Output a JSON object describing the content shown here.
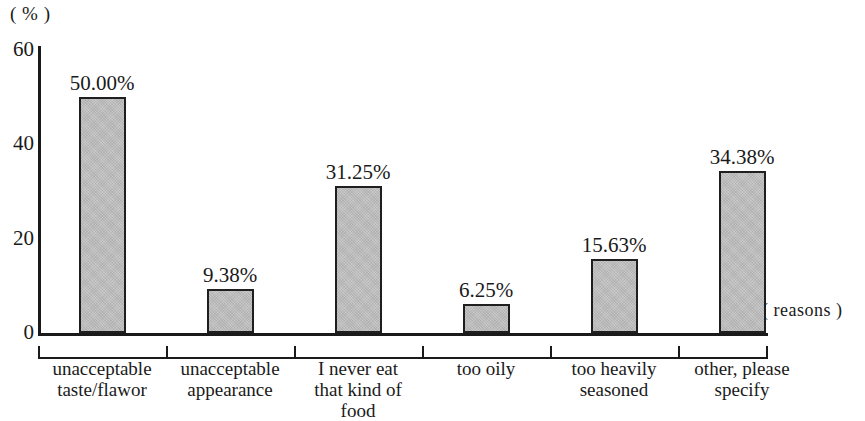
{
  "chart_data": {
    "type": "bar",
    "title": "",
    "subtitle": "",
    "xlabel": "( reasons )",
    "ylabel": "( % )",
    "categories": [
      "unacceptable taste/flawor",
      "unacceptable appearance",
      "I never eat that kind of food",
      "too oily",
      "too heavily seasoned",
      "other, please specify"
    ],
    "category_lines": [
      [
        "unacceptable",
        "taste/flawor"
      ],
      [
        "unacceptable",
        "appearance"
      ],
      [
        "I never eat",
        "that kind of",
        "food"
      ],
      [
        "too oily"
      ],
      [
        "too heavily",
        "seasoned"
      ],
      [
        "other, please",
        "specify"
      ]
    ],
    "values": [
      50.0,
      9.38,
      31.25,
      6.25,
      15.63,
      34.38
    ],
    "value_labels": [
      "50.00%",
      "9.38%",
      "31.25%",
      "6.25%",
      "15.63%",
      "34.38%"
    ],
    "ylim": [
      0,
      60
    ],
    "yticks": [
      0,
      20,
      40,
      60
    ],
    "ytick_labels": [
      "0",
      "20",
      "40",
      "60"
    ],
    "grid": false,
    "legend": null,
    "bar_color": "#c3c3c3",
    "bar_border_color": "#1f1f1f",
    "axis_color": "#1a1a1a"
  },
  "axes": {
    "y_unit": "( % )",
    "x_unit": "( reasons )"
  }
}
